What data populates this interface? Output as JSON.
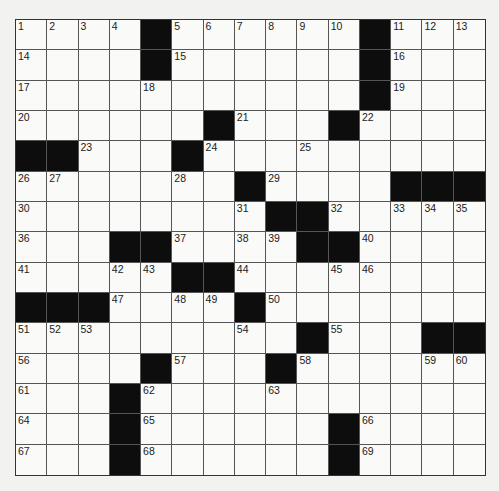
{
  "puzzle": {
    "rows": 15,
    "cols": 15,
    "colors": {
      "block": "#0d0d0d",
      "cell": "#fafaf8",
      "line": "#555555"
    },
    "grid": [
      [
        "1",
        "2",
        "3",
        "4",
        "#",
        "5",
        "6",
        "7",
        "8",
        "9",
        "10",
        "#",
        "11",
        "12",
        "13"
      ],
      [
        "14",
        ".",
        ".",
        ".",
        "#",
        "15",
        ".",
        ".",
        ".",
        ".",
        ".",
        "#",
        "16",
        ".",
        "."
      ],
      [
        "17",
        ".",
        ".",
        ".",
        "18",
        ".",
        ".",
        ".",
        ".",
        ".",
        ".",
        "#",
        "19",
        ".",
        "."
      ],
      [
        "20",
        ".",
        ".",
        ".",
        ".",
        ".",
        "#",
        "21",
        ".",
        ".",
        "#",
        "22",
        ".",
        ".",
        "."
      ],
      [
        "#",
        "#",
        "23",
        ".",
        ".",
        "#",
        "24",
        ".",
        ".",
        "25",
        ".",
        ".",
        ".",
        ".",
        "."
      ],
      [
        "26",
        "27",
        ".",
        ".",
        ".",
        "28",
        ".",
        "#",
        "29",
        ".",
        ".",
        ".",
        "#",
        "#",
        "#"
      ],
      [
        "30",
        ".",
        ".",
        ".",
        ".",
        ".",
        ".",
        "31",
        "#",
        "#",
        "32",
        ".",
        "33",
        "34",
        "35"
      ],
      [
        "36",
        ".",
        ".",
        "#",
        "#",
        "37",
        ".",
        "38",
        "39",
        "#",
        "#",
        "40",
        ".",
        ".",
        "."
      ],
      [
        "41",
        ".",
        ".",
        "42",
        "43",
        "#",
        "#",
        "44",
        ".",
        ".",
        "45",
        "46",
        ".",
        ".",
        "."
      ],
      [
        "#",
        "#",
        "#",
        "47",
        ".",
        "48",
        "49",
        "#",
        "50",
        ".",
        ".",
        ".",
        ".",
        ".",
        "."
      ],
      [
        "51",
        "52",
        "53",
        ".",
        ".",
        ".",
        ".",
        "54",
        ".",
        "#",
        "55",
        ".",
        ".",
        "#",
        "#"
      ],
      [
        "56",
        ".",
        ".",
        ".",
        "#",
        "57",
        ".",
        ".",
        "#",
        "58",
        ".",
        ".",
        ".",
        "59",
        "60"
      ],
      [
        "61",
        ".",
        ".",
        "#",
        "62",
        ".",
        ".",
        ".",
        "63",
        ".",
        ".",
        ".",
        ".",
        ".",
        "."
      ],
      [
        "64",
        ".",
        ".",
        "#",
        "65",
        ".",
        ".",
        ".",
        ".",
        ".",
        "#",
        "66",
        ".",
        ".",
        "."
      ],
      [
        "67",
        ".",
        ".",
        "#",
        "68",
        ".",
        ".",
        ".",
        ".",
        ".",
        "#",
        "69",
        ".",
        ".",
        "."
      ]
    ]
  }
}
